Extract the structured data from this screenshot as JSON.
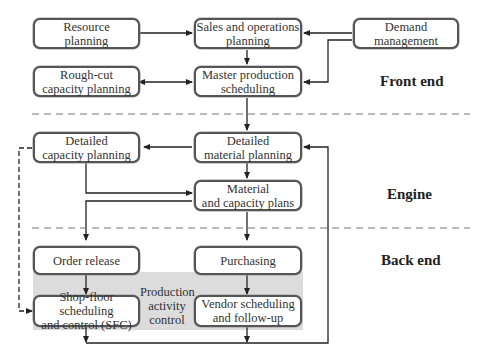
{
  "diagram": {
    "sections": {
      "front_end": "Front end",
      "engine": "Engine",
      "back_end": "Back end"
    },
    "boxes": {
      "resource_planning": "Resource\nplanning",
      "sales_operations_planning": "Sales and operations\nplanning",
      "demand_management": "Demand\nmanagement",
      "rough_cut_capacity_planning": "Rough-cut\ncapacity planning",
      "master_production_scheduling": "Master production\nscheduling",
      "detailed_capacity_planning": "Detailed\ncapacity planning",
      "detailed_material_planning": "Detailed\nmaterial planning",
      "material_capacity_plans": "Material\nand capacity plans",
      "order_release": "Order release",
      "purchasing": "Purchasing",
      "shop_floor_scheduling": "Shop-floor scheduling\nand control (SFC)",
      "vendor_scheduling": "Vendor scheduling\nand follow-up"
    },
    "shaded_region_label": "Production\nactivity\ncontrol",
    "colors": {
      "box_border": "#555555",
      "shade": "#dcdcdc",
      "line": "#222222",
      "divider": "#777777"
    }
  }
}
